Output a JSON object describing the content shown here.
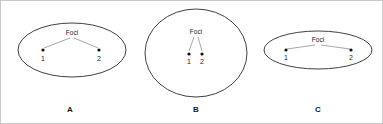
{
  "figure": {
    "background_color": "#ffffff",
    "outline_color": "#2b2b2b",
    "leader_color": "#6b6b6b",
    "dot_color": "#111111",
    "border_color": "#c9c9c9",
    "width": 383,
    "height": 124
  },
  "panels": [
    {
      "caption": "A",
      "caption_x": 70,
      "caption_y": 112,
      "shape": "ellipse",
      "cx": 72,
      "cy": 50,
      "rx": 54,
      "ry": 27,
      "foci_label": "Foci",
      "foci_label_x": 72,
      "foci_label_y": 35,
      "focus_1": {
        "number": "1",
        "x": 43,
        "y": 50,
        "label_x": 43,
        "label_y": 61
      },
      "focus_2": {
        "number": "2",
        "x": 99,
        "y": 50,
        "label_x": 99,
        "label_y": 61
      }
    },
    {
      "caption": "B",
      "caption_x": 196,
      "caption_y": 112,
      "shape": "ellipse",
      "cx": 196,
      "cy": 53,
      "rx": 51,
      "ry": 44,
      "foci_label": "Foci",
      "foci_label_x": 196,
      "foci_label_y": 34,
      "focus_1": {
        "number": "1",
        "x": 189,
        "y": 54,
        "label_x": 189,
        "label_y": 64
      },
      "focus_2": {
        "number": "2",
        "x": 202,
        "y": 54,
        "label_x": 202,
        "label_y": 64
      }
    },
    {
      "caption": "C",
      "caption_x": 318,
      "caption_y": 112,
      "shape": "ellipse",
      "cx": 318,
      "cy": 50,
      "rx": 54,
      "ry": 19,
      "foci_label": "Foci",
      "foci_label_x": 318,
      "foci_label_y": 42,
      "focus_1": {
        "number": "1",
        "x": 286,
        "y": 50,
        "label_x": 286,
        "label_y": 60
      },
      "focus_2": {
        "number": "2",
        "x": 351,
        "y": 50,
        "label_x": 351,
        "label_y": 60
      }
    }
  ]
}
